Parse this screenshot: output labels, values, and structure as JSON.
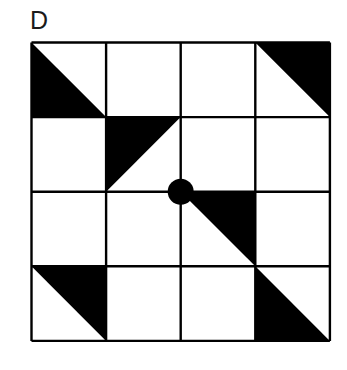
{
  "figure": {
    "label": "D",
    "type": "quilt-block-pattern",
    "background_color": "#ffffff",
    "ink_color": "#000000",
    "grid": {
      "rows": 4,
      "cols": 4,
      "line_color": "#000000",
      "line_width": 2.4,
      "cell_size": 74.6,
      "origin_x": 1.5,
      "origin_y": 1.5
    },
    "shapes": [
      {
        "name": "triangle-r0-c0",
        "row": 0,
        "col": 0,
        "shape": "triangle",
        "orientation": "lower-left",
        "fill": "#000000"
      },
      {
        "name": "triangle-r0-c3",
        "row": 0,
        "col": 3,
        "shape": "triangle",
        "orientation": "upper-right",
        "fill": "#000000"
      },
      {
        "name": "triangle-r1-c1",
        "row": 1,
        "col": 1,
        "shape": "triangle",
        "orientation": "upper-left",
        "fill": "#000000"
      },
      {
        "name": "triangle-r2-c2",
        "row": 2,
        "col": 2,
        "shape": "triangle",
        "orientation": "upper-right",
        "fill": "#000000"
      },
      {
        "name": "triangle-r3-c0",
        "row": 3,
        "col": 0,
        "shape": "triangle",
        "orientation": "upper-right",
        "fill": "#000000"
      },
      {
        "name": "triangle-r3-c3",
        "row": 3,
        "col": 3,
        "shape": "triangle",
        "orientation": "lower-left",
        "fill": "#000000"
      }
    ],
    "center_dot": {
      "name": "center-dot",
      "shape": "circle",
      "grid_x": 2,
      "grid_y": 2,
      "radius": 13,
      "fill": "#000000"
    }
  }
}
